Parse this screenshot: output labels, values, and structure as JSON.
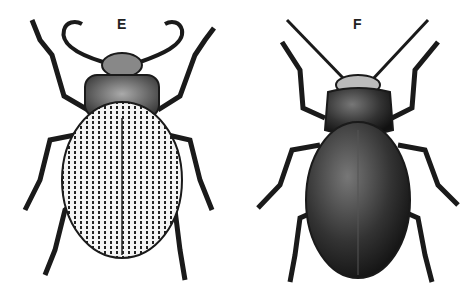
{
  "figure": {
    "panels": [
      {
        "label": "E",
        "subject": "beetle with striated elytra and curled antennae"
      },
      {
        "label": "F",
        "subject": "beetle with dark smooth elytra and long straight antennae"
      }
    ],
    "colors": {
      "ink": "#1a1a1a",
      "paper": "#ffffff",
      "shade": "#555555"
    }
  }
}
